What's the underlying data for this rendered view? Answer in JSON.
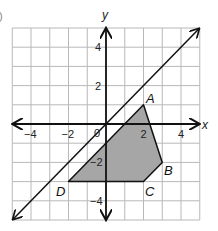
{
  "figure": {
    "corner_mark": ")",
    "axes": {
      "x_label": "x",
      "y_label": "y",
      "origin_label": "0",
      "x_ticks": [
        {
          "value": -4,
          "label": "−4"
        },
        {
          "value": -2,
          "label": "−2"
        },
        {
          "value": 2,
          "label": "2"
        },
        {
          "value": 4,
          "label": "4"
        }
      ],
      "y_ticks": [
        {
          "value": 4,
          "label": "4"
        },
        {
          "value": 2,
          "label": "2"
        },
        {
          "value": -2,
          "label": "−2"
        },
        {
          "value": -4,
          "label": "−4"
        }
      ]
    },
    "vertex_labels": {
      "A": "A",
      "B": "B",
      "C": "C",
      "D": "D"
    }
  },
  "chart_data": {
    "type": "scatter",
    "title": "",
    "xlabel": "x",
    "ylabel": "y",
    "xlim": [
      -5,
      5
    ],
    "ylim": [
      -5,
      5
    ],
    "grid": true,
    "grid_step": 1,
    "x_ticks": [
      -4,
      -2,
      2,
      4
    ],
    "y_ticks": [
      4,
      2,
      -2,
      -4
    ],
    "origin_label": "0",
    "polygon": {
      "name": "ABCD",
      "shaded": true,
      "fill": "#a6a6a6",
      "vertices": [
        {
          "label": "A",
          "x": 2,
          "y": 1
        },
        {
          "label": "B",
          "x": 3,
          "y": -2
        },
        {
          "label": "C",
          "x": 2,
          "y": -3
        },
        {
          "label": "D",
          "x": -2,
          "y": -3
        }
      ]
    },
    "lines": [
      {
        "equation": "y = x",
        "slope": 1,
        "intercept": 0,
        "from": [
          -5,
          -5
        ],
        "to": [
          5,
          5
        ],
        "arrows": "both"
      }
    ],
    "colors": {
      "grid": "#b8b8b8",
      "axes": "#111111",
      "polygon_fill": "#a6a6a6"
    }
  }
}
